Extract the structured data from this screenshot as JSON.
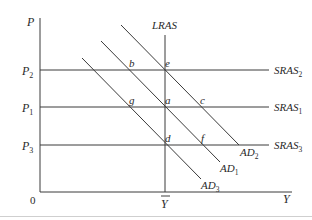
{
  "diagram": {
    "type": "AD-AS model",
    "axes": {
      "y_label": "P",
      "x_label": "Y",
      "origin_label": "0",
      "potential_output_label": "Y",
      "price_levels": [
        {
          "id": "p2",
          "label": "P",
          "sub": "2"
        },
        {
          "id": "p1",
          "label": "P",
          "sub": "1"
        },
        {
          "id": "p3",
          "label": "P",
          "sub": "3"
        }
      ]
    },
    "curves": {
      "lras": {
        "label": "LRAS"
      },
      "sras2": {
        "label": "SRAS",
        "sub": "2"
      },
      "sras1": {
        "label": "SRAS",
        "sub": "1"
      },
      "sras3": {
        "label": "SRAS",
        "sub": "3"
      },
      "ad2": {
        "label": "AD",
        "sub": "2"
      },
      "ad1": {
        "label": "AD",
        "sub": "1"
      },
      "ad3": {
        "label": "AD",
        "sub": "3"
      }
    },
    "points": {
      "b": "b",
      "e": "e",
      "g": "g",
      "a": "a",
      "c": "c",
      "d": "d",
      "f": "f"
    }
  }
}
